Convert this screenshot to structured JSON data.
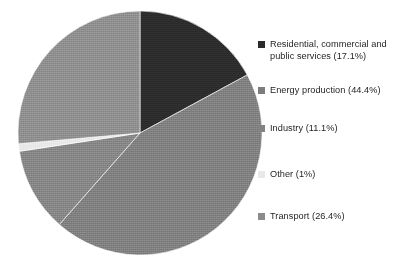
{
  "chart_data": {
    "type": "pie",
    "title": "",
    "categories": [
      "Residential, commercial and public services",
      "Energy production",
      "Industry",
      "Other",
      "Transport"
    ],
    "values": [
      17.1,
      44.4,
      11.1,
      1,
      26.4
    ],
    "value_unit": "%",
    "start_angle_deg": 0,
    "direction": "clockwise",
    "legend_position": "right",
    "grid": false,
    "slices": [
      {
        "name": "Residential, commercial and public services",
        "legend_text": "Residential, commercial and\npublic services (17.1%)",
        "value": 17.1,
        "color": "#2b2b2b",
        "start_deg": 0,
        "end_deg": 61.56
      },
      {
        "name": "Energy production",
        "legend_text": "Energy production (44.4%)",
        "value": 44.4,
        "color": "#7d7d7d",
        "start_deg": 61.56,
        "end_deg": 221.4
      },
      {
        "name": "Industry",
        "legend_text": "Industry (11.1%)",
        "value": 11.1,
        "color": "#838383",
        "start_deg": 221.4,
        "end_deg": 261.36
      },
      {
        "name": "Other",
        "legend_text": "Other (1%)",
        "value": 1,
        "color": "#e8e8e8",
        "start_deg": 261.36,
        "end_deg": 264.96
      },
      {
        "name": "Transport",
        "legend_text": "Transport (26.4%)",
        "value": 26.4,
        "color": "#8c8c8c",
        "start_deg": 264.96,
        "end_deg": 360
      }
    ]
  },
  "legend": {
    "items": [
      {
        "label": "Residential, commercial and\npublic services (17.1%)",
        "color": "#2b2b2b",
        "top": 38
      },
      {
        "label": "Energy production (44.4%)",
        "color": "#7d7d7d",
        "top": 84
      },
      {
        "label": "Industry (11.1%)",
        "color": "#838383",
        "top": 122
      },
      {
        "label": "Other (1%)",
        "color": "#e8e8e8",
        "top": 168
      },
      {
        "label": "Transport (26.4%)",
        "color": "#8c8c8c",
        "top": 210
      }
    ]
  },
  "colors": {
    "background": "#ffffff",
    "text": "#1f1f1f",
    "residential": "#2b2b2b",
    "energy_production": "#7d7d7d",
    "industry": "#838383",
    "other": "#e8e8e8",
    "transport": "#8c8c8c"
  }
}
